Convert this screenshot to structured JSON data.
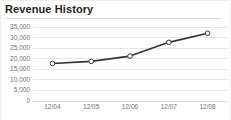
{
  "widget": {
    "title": "Revenue History"
  },
  "chart_data": {
    "type": "line",
    "title": "Revenue History",
    "xlabel": "",
    "ylabel": "",
    "categories": [
      "12/04",
      "12/05",
      "12/06",
      "12/07",
      "12/08"
    ],
    "values": [
      17500,
      18500,
      21000,
      27500,
      31800
    ],
    "series": [
      {
        "name": "Revenue",
        "values": [
          17500,
          18500,
          21000,
          27500,
          31800
        ]
      }
    ],
    "ylim": [
      0,
      35000
    ],
    "yticks": [
      35000,
      30000,
      25000,
      20000,
      15000,
      10000,
      5000,
      0
    ],
    "ytick_labels": [
      "35,000",
      "30,000",
      "25,000",
      "20,000",
      "15,000",
      "10,000",
      "5,000",
      "0"
    ],
    "xtick_labels": [
      "12/04",
      "12/05",
      "12/06",
      "12/07",
      "12/08"
    ],
    "grid": true,
    "legend": "none",
    "line_color": "#333333",
    "marker": "open-circle",
    "marker_fill": "#ffffff",
    "grid_color": "#e6e6e6",
    "tick_text_color": "#6f6f6f",
    "title_color": "#231f20"
  }
}
